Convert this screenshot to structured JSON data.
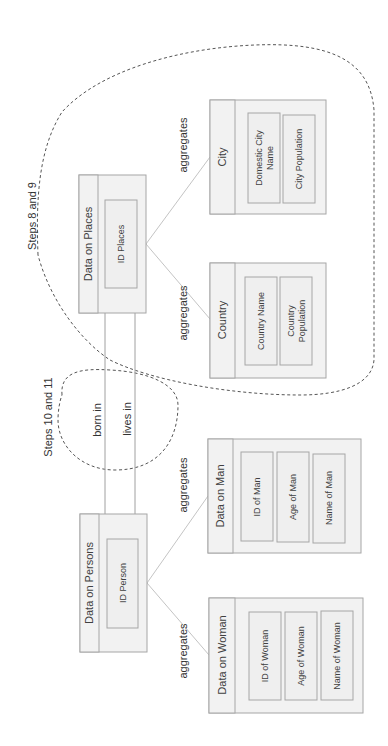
{
  "diagram": {
    "orientation": "rotated-90-ccw",
    "entities": {
      "places": {
        "title": "Data on Places",
        "attributes": [
          "ID Places"
        ]
      },
      "city": {
        "title": "City",
        "attributes": [
          "Domestic City",
          "Name",
          "City Population"
        ]
      },
      "country": {
        "title": "Country",
        "attributes": [
          "Country Name",
          "Country",
          "Population"
        ]
      },
      "persons": {
        "title": "Data on Persons",
        "attributes": [
          "ID Person"
        ]
      },
      "man": {
        "title": "Data on Man",
        "attributes": [
          "ID of Man",
          "Age of Man",
          "Name of Man"
        ]
      },
      "woman": {
        "title": "Data on Woman",
        "attributes": [
          "ID of Woman",
          "Age of Woman",
          "Name of Woman"
        ]
      }
    },
    "relations": {
      "born_in": "born in",
      "lives_in": "lives in",
      "agg_city": "aggregates",
      "agg_country": "aggregates",
      "agg_man": "aggregates",
      "agg_woman": "aggregates"
    },
    "groups": {
      "steps_8_9": "Steps 8 and 9",
      "steps_10_11": "Steps 10 and 11"
    }
  }
}
